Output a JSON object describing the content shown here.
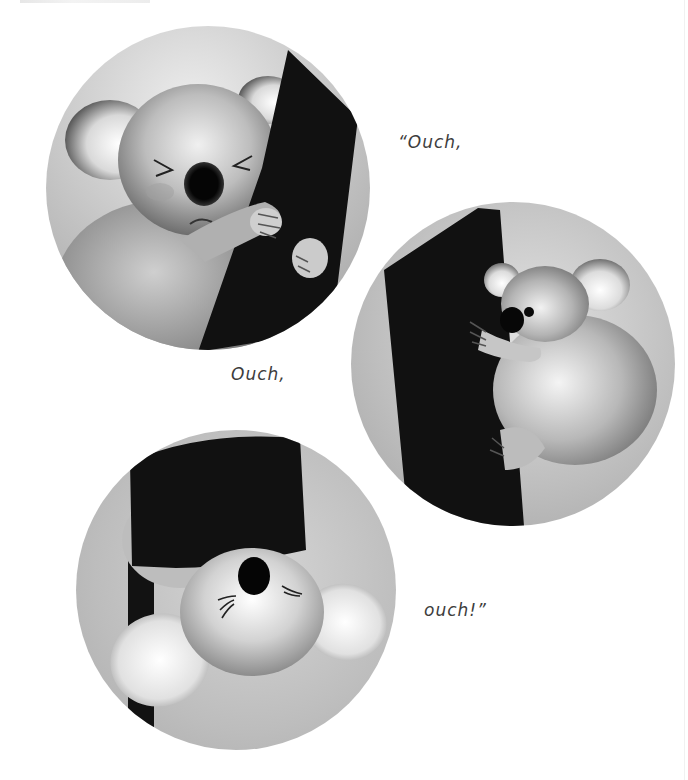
{
  "page": {
    "background": "#ffffff"
  },
  "captions": [
    {
      "id": "caption-1",
      "text": "“Ouch,",
      "x": 398,
      "y": 132
    },
    {
      "id": "caption-2",
      "text": "Ouch,",
      "x": 231,
      "y": 364
    },
    {
      "id": "caption-3",
      "text": "ouch!”",
      "x": 424,
      "y": 600
    }
  ],
  "illustrations": [
    {
      "id": "panel-1",
      "subject": "koala-squinting-hugging-tree",
      "cx": 208,
      "cy": 188,
      "r": 162
    },
    {
      "id": "panel-2",
      "subject": "koala-climbing-tree-side-view",
      "cx": 513,
      "cy": 364,
      "r": 162
    },
    {
      "id": "panel-3",
      "subject": "koala-looking-up-from-below-tree",
      "cx": 236,
      "cy": 590,
      "r": 160
    }
  ],
  "colors": {
    "text": "#3d3d3d",
    "bark": "#121212",
    "fur_light": "#e6e6e6",
    "fur_mid": "#9a9a9a",
    "bg_circle": "#b8b8b8"
  }
}
